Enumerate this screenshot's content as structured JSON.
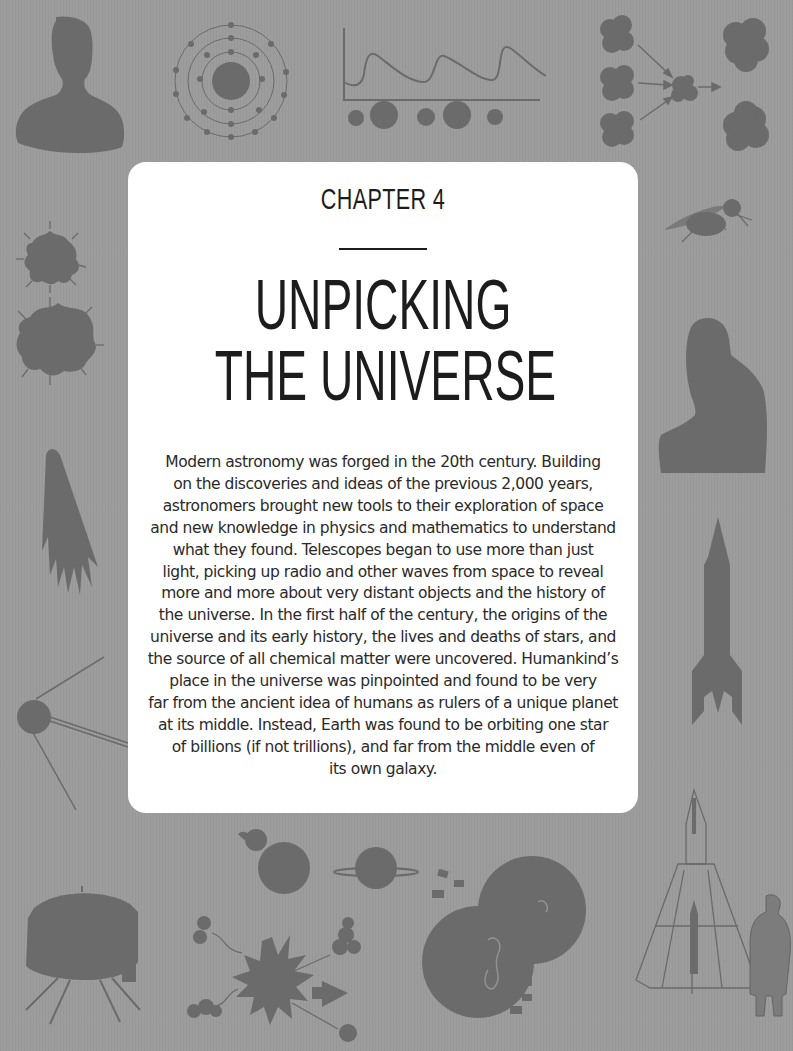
{
  "page": {
    "background_color": "#9b9b9b",
    "panel_color": "#ffffff",
    "icon_color": "#6b6b6b",
    "text_color": "#1c1c1c"
  },
  "chapter": {
    "label": "CHAPTER 4",
    "title_lines": [
      "UNPICKING",
      "THE UNIVERSE"
    ]
  },
  "body": {
    "lines": [
      "Modern astronomy was forged in the 20th century. Building",
      "on the discoveries and ideas of the previous 2,000 years,",
      "astronomers brought new tools to their exploration of space",
      "and new knowledge in physics and mathematics to understand",
      "what they found. Telescopes began to use more than just",
      "light, picking up radio and other waves from space to reveal",
      "more and more about very distant objects and the history of",
      "the universe. In the first half of the century, the origins of the",
      "universe and its early history, the lives and deaths of stars, and",
      "the source of all chemical matter were uncovered. Humankind’s",
      "place in the universe was pinpointed and found to be very",
      "far from the ancient idea of humans as rulers of a unique planet",
      "at its middle. Instead, Earth was found to be orbiting one star",
      "of billions (if not trillions), and far from the middle even of",
      "its own galaxy."
    ]
  },
  "decorations": [
    "person-silhouette-icon",
    "atom-icon",
    "spectrum-graph-icon",
    "nuclear-fusion-icon",
    "fly-icon",
    "expanding-universe-icon",
    "comet-icon",
    "seated-person-silhouette-icon",
    "v2-rocket-icon",
    "sputnik-icon",
    "space-probe-icon",
    "planets-icon",
    "supernova-icon",
    "earth-collision-icon",
    "goddard-rocket-icon"
  ]
}
